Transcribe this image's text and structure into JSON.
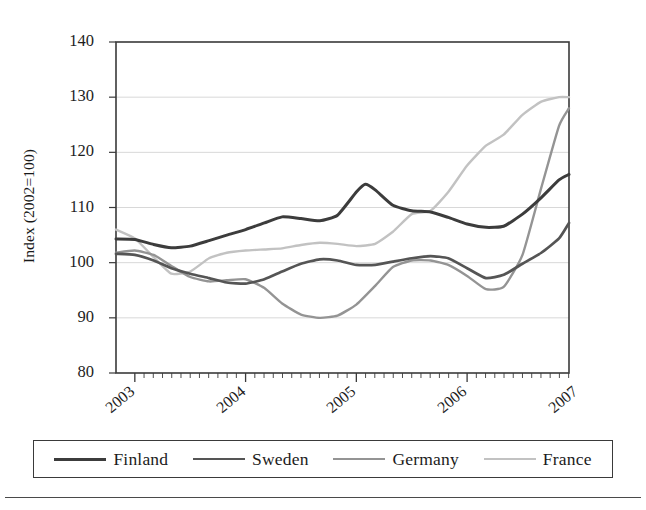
{
  "chart_data": {
    "type": "line",
    "title": "",
    "xlabel": "",
    "ylabel": "Index (2002=100)",
    "ylim": [
      80,
      140
    ],
    "yticks": [
      80,
      90,
      100,
      110,
      120,
      130,
      140
    ],
    "xlim": [
      2002.83,
      2006.92
    ],
    "xticks": [
      2003,
      2004,
      2005,
      2006,
      2007
    ],
    "xticklabels": [
      "2003",
      "2004",
      "2005",
      "2006",
      "2007"
    ],
    "grid": "horizontal",
    "legend_position": "below",
    "series": [
      {
        "name": "Finland",
        "color": "#3c3c3c",
        "x": [
          2002.83,
          2003.0,
          2003.17,
          2003.33,
          2003.5,
          2003.67,
          2003.83,
          2004.0,
          2004.17,
          2004.33,
          2004.5,
          2004.67,
          2004.83,
          2005.0,
          2005.08,
          2005.17,
          2005.33,
          2005.5,
          2005.67,
          2005.83,
          2006.0,
          2006.17,
          2006.33,
          2006.5,
          2006.67,
          2006.83,
          2006.92
        ],
        "y": [
          104.3,
          104.2,
          103.3,
          102.7,
          103.0,
          104.0,
          105.0,
          106.0,
          107.2,
          108.3,
          108.0,
          107.6,
          108.6,
          112.8,
          114.2,
          113.2,
          110.4,
          109.4,
          109.2,
          108.2,
          107.0,
          106.4,
          106.6,
          108.8,
          111.8,
          115.0,
          116.0
        ]
      },
      {
        "name": "Sweden",
        "color": "#555555",
        "x": [
          2002.83,
          2003.0,
          2003.17,
          2003.33,
          2003.5,
          2003.67,
          2003.83,
          2004.0,
          2004.17,
          2004.33,
          2004.5,
          2004.67,
          2004.83,
          2005.0,
          2005.17,
          2005.33,
          2005.5,
          2005.67,
          2005.83,
          2006.0,
          2006.17,
          2006.33,
          2006.5,
          2006.67,
          2006.83,
          2006.92
        ],
        "y": [
          101.6,
          101.4,
          100.4,
          99.0,
          98.0,
          97.2,
          96.4,
          96.2,
          97.0,
          98.4,
          99.8,
          100.6,
          100.4,
          99.6,
          99.6,
          100.2,
          100.8,
          101.2,
          100.8,
          99.0,
          97.2,
          97.8,
          99.8,
          101.8,
          104.4,
          107.2
        ]
      },
      {
        "name": "Germany",
        "color": "#949494",
        "x": [
          2002.83,
          2003.0,
          2003.17,
          2003.33,
          2003.5,
          2003.67,
          2003.83,
          2004.0,
          2004.17,
          2004.33,
          2004.5,
          2004.67,
          2004.83,
          2005.0,
          2005.17,
          2005.33,
          2005.5,
          2005.67,
          2005.83,
          2006.0,
          2006.17,
          2006.33,
          2006.5,
          2006.67,
          2006.83,
          2006.92
        ],
        "y": [
          101.8,
          102.2,
          101.4,
          99.4,
          97.4,
          96.6,
          96.8,
          97.0,
          95.4,
          92.6,
          90.6,
          90.0,
          90.4,
          92.4,
          95.8,
          99.2,
          100.4,
          100.4,
          99.6,
          97.6,
          95.2,
          95.6,
          101.4,
          113.6,
          124.8,
          128.0
        ]
      },
      {
        "name": "France",
        "color": "#c2c2c2",
        "x": [
          2002.83,
          2003.0,
          2003.17,
          2003.33,
          2003.5,
          2003.67,
          2003.83,
          2004.0,
          2004.17,
          2004.33,
          2004.5,
          2004.67,
          2004.83,
          2005.0,
          2005.17,
          2005.33,
          2005.5,
          2005.67,
          2005.83,
          2006.0,
          2006.17,
          2006.33,
          2006.5,
          2006.67,
          2006.83,
          2006.92
        ],
        "y": [
          106.0,
          104.4,
          101.0,
          98.0,
          98.4,
          100.8,
          101.8,
          102.2,
          102.4,
          102.6,
          103.2,
          103.6,
          103.4,
          103.0,
          103.4,
          105.6,
          108.8,
          109.4,
          112.8,
          117.6,
          121.2,
          123.2,
          126.8,
          129.2,
          130.0,
          130.0
        ]
      }
    ]
  },
  "axes": {
    "y_title": "Index (2002=100)",
    "y_tick_labels": [
      "140",
      "130",
      "120",
      "110",
      "100",
      "90",
      "80"
    ],
    "x_tick_labels": [
      "2003",
      "2004",
      "2005",
      "2006",
      "2007"
    ]
  },
  "legend": {
    "entries": [
      {
        "label": "Finland",
        "color": "#3c3c3c",
        "width": "3px"
      },
      {
        "label": "Sweden",
        "color": "#555555",
        "width": "2.6px"
      },
      {
        "label": "Germany",
        "color": "#949494",
        "width": "2.4px"
      },
      {
        "label": "France",
        "color": "#c2c2c2",
        "width": "2.4px"
      }
    ]
  },
  "plot_box": {
    "left": 116,
    "top": 42,
    "right": 569,
    "bottom": 373,
    "border_color": "#3a3a3a",
    "grid_color": "#d8d8d8"
  }
}
